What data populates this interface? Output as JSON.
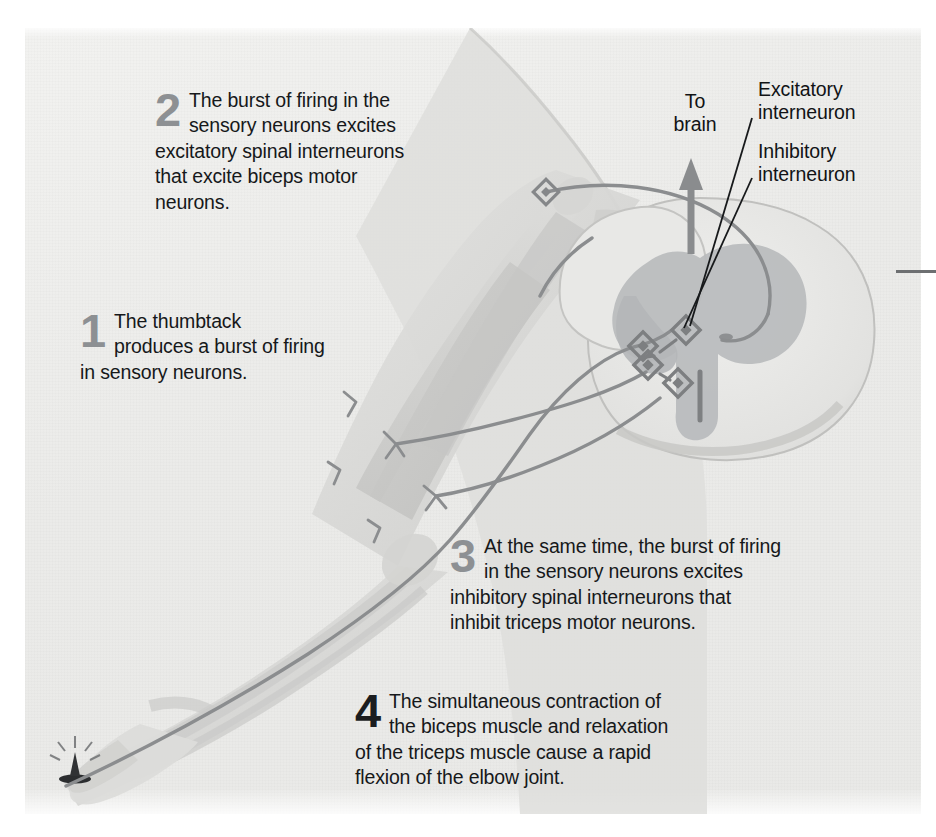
{
  "figure": {
    "background_color": "#ebebe9",
    "page_color": "#ffffff"
  },
  "callouts": [
    {
      "number": "1",
      "text": "The thumbtack\nproduces a burst of firing\nin sensory neurons.",
      "number_color": "#8d9093"
    },
    {
      "number": "2",
      "text": "The burst of firing in the\nsensory neurons excites\nexcitatory spinal interneurons\nthat excite biceps motor\nneurons.",
      "number_color": "#8d9093"
    },
    {
      "number": "3",
      "text": "At the same time, the burst of firing\nin the sensory neurons excites\ninhibitory spinal interneurons that\ninhibit triceps motor neurons.",
      "number_color": "#6f7275"
    },
    {
      "number": "4",
      "text": "The simultaneous contraction of\nthe biceps muscle and relaxation\nof the triceps muscle cause a rapid\nflexion of the elbow joint.",
      "number_color": "#1b1d1f"
    }
  ],
  "leader_labels": {
    "to_brain": "To\nbrain",
    "excitatory_interneuron": "Excitatory\ninterneuron",
    "inhibitory_interneuron": "Inhibitory\ninterneuron"
  },
  "artwork": {
    "arm_icon": "human-arm-anatomy",
    "spinal_cord_icon": "spinal-cord-cross-section",
    "thumbtack_icon": "thumbtack",
    "arrow_icon": "up-arrow-to-brain",
    "synapse_icon": "synapse-marker",
    "colors": {
      "skin": "#dcdcda",
      "muscle": "#c8c8c6",
      "bone": "#d2d2d0",
      "nerve": "#8a8c8e",
      "gray_matter": "#b6b8ba",
      "white_matter": "#e4e4e2",
      "outline": "#9a9c9e",
      "leader_line": "#1a1c1e",
      "arrow": "#8a8c8e",
      "thumbtack": "#2a2c2e"
    },
    "synapse_count": 4
  }
}
